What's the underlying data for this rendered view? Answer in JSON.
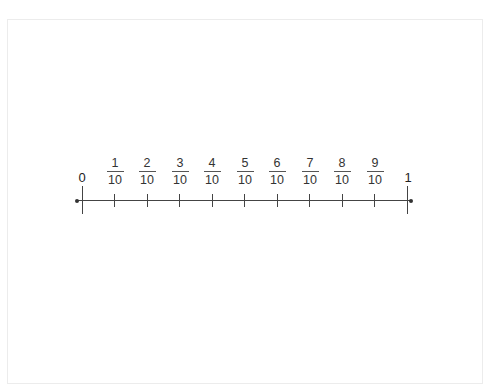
{
  "diagram": {
    "type": "number-line",
    "start_label": "0",
    "end_label": "1",
    "fractions": [
      {
        "num": "1",
        "den": "10"
      },
      {
        "num": "2",
        "den": "10"
      },
      {
        "num": "3",
        "den": "10"
      },
      {
        "num": "4",
        "den": "10"
      },
      {
        "num": "5",
        "den": "10"
      },
      {
        "num": "6",
        "den": "10"
      },
      {
        "num": "7",
        "den": "10"
      },
      {
        "num": "8",
        "den": "10"
      },
      {
        "num": "9",
        "den": "10"
      }
    ],
    "colors": {
      "line": "#444444",
      "text": "#333333",
      "frame": "#ececec"
    }
  }
}
